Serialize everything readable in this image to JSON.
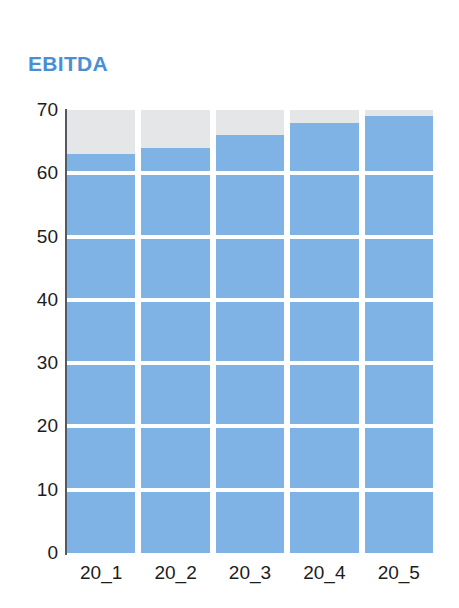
{
  "chart_data": {
    "type": "bar",
    "title": "EBITDA",
    "xlabel": "",
    "ylabel": "",
    "categories": [
      "20_1",
      "20_2",
      "20_3",
      "20_4",
      "20_5"
    ],
    "values": [
      63,
      64,
      66,
      68,
      69
    ],
    "ylim": [
      0,
      70
    ],
    "ytick_step": 10,
    "yticks": [
      0,
      10,
      20,
      30,
      40,
      50,
      60,
      70
    ],
    "ytick_labels": [
      "0",
      "10",
      "20",
      "30",
      "40",
      "50",
      "60",
      "70"
    ],
    "grid": true,
    "grid_color": "#ffffff",
    "grid_orientation": "horizontal",
    "legend": false,
    "legend_position": "none",
    "series": [
      {
        "name": "EBITDA",
        "values": [
          63,
          64,
          66,
          68,
          69
        ]
      }
    ]
  },
  "style": {
    "title_color": "#4a8fd4",
    "bar_color": "#7fb2e5",
    "bar_track_color": "#e4e6e8",
    "axis_color": "#555a60",
    "tick_label_color": "#1c1c1c",
    "background_color": "#ffffff"
  }
}
